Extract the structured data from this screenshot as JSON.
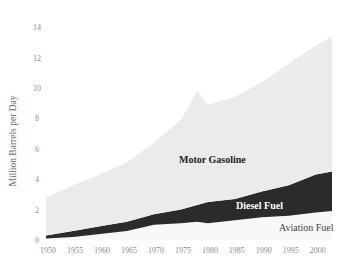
{
  "chart_data": {
    "type": "area",
    "stacked": true,
    "title": "",
    "xlabel": "",
    "ylabel": "Million Barrels per Day",
    "ylim": [
      0,
      14
    ],
    "yticks": [
      0,
      2,
      4,
      6,
      8,
      10,
      12,
      14
    ],
    "xticks": [
      1950,
      1955,
      1960,
      1965,
      1970,
      1975,
      1980,
      1985,
      1990,
      1995,
      2000
    ],
    "grid": false,
    "legend": "inline-labels",
    "x": [
      1950,
      1955,
      1960,
      1965,
      1970,
      1975,
      1978,
      1980,
      1985,
      1990,
      1995,
      2000,
      2003
    ],
    "series": [
      {
        "name": "Aviation Fuel",
        "color": "#f7f7f7",
        "values": [
          0.1,
          0.2,
          0.4,
          0.6,
          1.0,
          1.1,
          1.2,
          1.1,
          1.3,
          1.5,
          1.6,
          1.8,
          1.9
        ]
      },
      {
        "name": "Diesel Fuel",
        "color": "#2b2b2b",
        "values": [
          0.2,
          0.4,
          0.5,
          0.6,
          0.7,
          0.9,
          1.1,
          1.4,
          1.4,
          1.7,
          2.0,
          2.5,
          2.6
        ]
      },
      {
        "name": "Motor Gasoline",
        "color": "#ebebeb",
        "values": [
          2.5,
          3.0,
          3.4,
          3.9,
          4.7,
          5.9,
          7.5,
          6.4,
          6.7,
          7.2,
          8.0,
          8.5,
          8.9
        ]
      }
    ],
    "annotations": [
      {
        "text": "Motor Gasoline",
        "x": 1976,
        "y": 5.3,
        "color": "#222222"
      },
      {
        "text": "Diesel Fuel",
        "x": 1986,
        "y": 2.4,
        "color": "#ffffff"
      },
      {
        "text": "Aviation Fuel",
        "x": 1997,
        "y": 0.7,
        "color": "#444444"
      }
    ]
  },
  "axis": {
    "ylabel": "Million Barrels per Day",
    "yticks": [
      "0",
      "2",
      "4",
      "6",
      "8",
      "10",
      "12",
      "14"
    ],
    "xticks": [
      "1950",
      "1955",
      "1960",
      "1965",
      "1970",
      "1975",
      "1980",
      "1985",
      "1990",
      "1995",
      "2000"
    ]
  },
  "labels": {
    "gasoline": "Motor Gasoline",
    "diesel": "Diesel Fuel",
    "aviation": "Aviation Fuel"
  }
}
